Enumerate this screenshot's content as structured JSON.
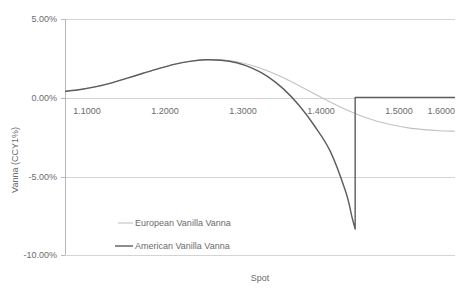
{
  "chart_data": {
    "type": "line",
    "title": "",
    "xlabel": "Spot",
    "ylabel": "Vanna (CCY1%)",
    "xlim": [
      1.1,
      1.6
    ],
    "ylim": [
      -0.1,
      0.05
    ],
    "grid": true,
    "legend_position": "inside-lower-left",
    "x_tick_labels": [
      "1.1000",
      "1.2000",
      "1.3000",
      "1.4000",
      "1.5000",
      "1.6000"
    ],
    "x_tick_values": [
      1.1,
      1.2,
      1.3,
      1.4,
      1.5,
      1.6
    ],
    "y_tick_labels": [
      "5.00%",
      "0.00%",
      "-5.00%",
      "-10.00%"
    ],
    "y_tick_values": [
      0.05,
      0.0,
      -0.05,
      -0.1
    ],
    "series": [
      {
        "name": "European Vanilla Vanna",
        "color": "#c2c2c2",
        "width": 1.1,
        "x": [
          1.1,
          1.12,
          1.14,
          1.16,
          1.18,
          1.2,
          1.22,
          1.24,
          1.26,
          1.28,
          1.3,
          1.32,
          1.34,
          1.36,
          1.38,
          1.4,
          1.42,
          1.44,
          1.46,
          1.48,
          1.5,
          1.52,
          1.54,
          1.56,
          1.58,
          1.6
        ],
        "values": [
          0.004,
          0.0052,
          0.007,
          0.0094,
          0.0124,
          0.0155,
          0.0185,
          0.0212,
          0.0231,
          0.0241,
          0.024,
          0.0228,
          0.0205,
          0.017,
          0.0126,
          0.0076,
          0.0024,
          -0.0028,
          -0.0076,
          -0.0117,
          -0.015,
          -0.0174,
          -0.0192,
          -0.0203,
          -0.021,
          -0.0213
        ]
      },
      {
        "name": "American Vanilla Vanna",
        "color": "#5c5c5c",
        "width": 1.4,
        "x": [
          1.1,
          1.12,
          1.14,
          1.16,
          1.18,
          1.2,
          1.22,
          1.24,
          1.26,
          1.28,
          1.3,
          1.32,
          1.34,
          1.36,
          1.38,
          1.4,
          1.42,
          1.44,
          1.46,
          1.468,
          1.472
        ],
        "values": [
          0.004,
          0.0052,
          0.007,
          0.0094,
          0.0124,
          0.0155,
          0.0185,
          0.0212,
          0.0231,
          0.0241,
          0.0238,
          0.0222,
          0.0188,
          0.0134,
          0.0056,
          -0.0048,
          -0.018,
          -0.034,
          -0.06,
          -0.076,
          -0.0835
        ],
        "jump": {
          "x": 1.472,
          "from": -0.0835,
          "to": 0.0002
        },
        "x_after": [
          1.472,
          1.5,
          1.55,
          1.6
        ],
        "values_after": [
          0.0002,
          0.0002,
          0.0002,
          0.0002
        ]
      }
    ]
  },
  "legend": {
    "items": [
      {
        "label": "European Vanilla Vanna",
        "color": "#c2c2c2"
      },
      {
        "label": "American Vanilla Vanna",
        "color": "#5c5c5c"
      }
    ]
  },
  "axes": {
    "x_title": "Spot",
    "y_title": "Vanna (CCY1%)"
  }
}
